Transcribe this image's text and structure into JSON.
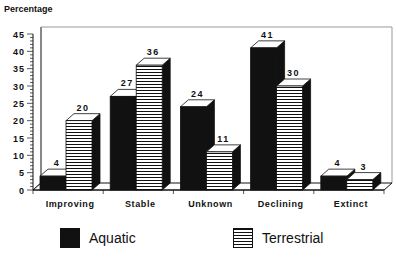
{
  "chart_data": {
    "type": "bar",
    "title": "",
    "ylabel": "Percentage",
    "xlabel": "",
    "categories": [
      "Improving",
      "Stable",
      "Unknown",
      "Declining",
      "Extinct"
    ],
    "series": [
      {
        "name": "Aquatic",
        "values": [
          4,
          27,
          24,
          41,
          4
        ],
        "pattern": "solid",
        "color": "#111111"
      },
      {
        "name": "Terrestrial",
        "values": [
          20,
          36,
          11,
          30,
          3
        ],
        "pattern": "horizontal-stripes",
        "color": "#111111"
      }
    ],
    "ylim": [
      0,
      45
    ],
    "yticks": [
      0,
      5,
      10,
      15,
      20,
      25,
      30,
      35,
      40,
      45
    ],
    "data_labels": true,
    "style": "3d",
    "grid": false,
    "legend_position": "bottom"
  },
  "axis": {
    "ylabel": "Percentage"
  },
  "legend": {
    "items": [
      {
        "label": "Aquatic"
      },
      {
        "label": "Terrestrial"
      }
    ]
  }
}
